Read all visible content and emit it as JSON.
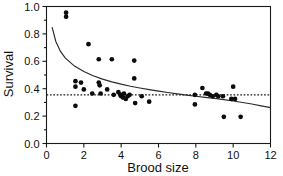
{
  "chart_data": {
    "type": "scatter",
    "title": "",
    "xlabel": "Brood size",
    "ylabel": "Survival",
    "xlim": [
      0,
      12
    ],
    "ylim": [
      0,
      1.0
    ],
    "xticks": [
      0,
      2,
      4,
      6,
      8,
      10,
      12
    ],
    "xticklabels": [
      "0",
      "2",
      "4",
      "6",
      "8",
      "10",
      "12"
    ],
    "yticks": [
      0.0,
      0.2,
      0.4,
      0.6,
      0.8,
      1.0
    ],
    "yticklabels": [
      "0.0",
      "0.2",
      "0.4",
      "0.6",
      "0.8",
      "1.0"
    ],
    "grid": false,
    "legend": null,
    "marker": "filled-circle",
    "marker_color": "#0b0b0b",
    "points": [
      {
        "x": 1.05,
        "y": 0.955
      },
      {
        "x": 1.05,
        "y": 0.925
      },
      {
        "x": 1.55,
        "y": 0.455
      },
      {
        "x": 1.55,
        "y": 0.415
      },
      {
        "x": 1.55,
        "y": 0.275
      },
      {
        "x": 1.85,
        "y": 0.445
      },
      {
        "x": 2.0,
        "y": 0.395
      },
      {
        "x": 2.25,
        "y": 0.725
      },
      {
        "x": 2.45,
        "y": 0.365
      },
      {
        "x": 2.8,
        "y": 0.615
      },
      {
        "x": 2.8,
        "y": 0.445
      },
      {
        "x": 2.85,
        "y": 0.425
      },
      {
        "x": 2.9,
        "y": 0.365
      },
      {
        "x": 3.25,
        "y": 0.395
      },
      {
        "x": 3.5,
        "y": 0.615
      },
      {
        "x": 3.6,
        "y": 0.355
      },
      {
        "x": 3.85,
        "y": 0.375
      },
      {
        "x": 3.95,
        "y": 0.355
      },
      {
        "x": 4.0,
        "y": 0.345
      },
      {
        "x": 4.05,
        "y": 0.355
      },
      {
        "x": 4.1,
        "y": 0.335
      },
      {
        "x": 4.15,
        "y": 0.365
      },
      {
        "x": 4.25,
        "y": 0.325
      },
      {
        "x": 4.35,
        "y": 0.345
      },
      {
        "x": 4.45,
        "y": 0.355
      },
      {
        "x": 4.7,
        "y": 0.605
      },
      {
        "x": 4.7,
        "y": 0.475
      },
      {
        "x": 4.75,
        "y": 0.295
      },
      {
        "x": 5.1,
        "y": 0.345
      },
      {
        "x": 5.5,
        "y": 0.305
      },
      {
        "x": 7.95,
        "y": 0.355
      },
      {
        "x": 7.95,
        "y": 0.285
      },
      {
        "x": 8.35,
        "y": 0.405
      },
      {
        "x": 8.55,
        "y": 0.365
      },
      {
        "x": 8.65,
        "y": 0.365
      },
      {
        "x": 8.75,
        "y": 0.355
      },
      {
        "x": 8.9,
        "y": 0.345
      },
      {
        "x": 9.1,
        "y": 0.355
      },
      {
        "x": 9.2,
        "y": 0.345
      },
      {
        "x": 9.45,
        "y": 0.345
      },
      {
        "x": 9.5,
        "y": 0.195
      },
      {
        "x": 9.9,
        "y": 0.325
      },
      {
        "x": 10.0,
        "y": 0.415
      },
      {
        "x": 10.1,
        "y": 0.325
      },
      {
        "x": 10.4,
        "y": 0.195
      }
    ],
    "fit_curve": {
      "label": "fitted-decay-curve",
      "style": "solid",
      "color": "#2b2b2b",
      "points": [
        {
          "x": 0.3,
          "y": 0.85
        },
        {
          "x": 0.5,
          "y": 0.745
        },
        {
          "x": 0.75,
          "y": 0.672
        },
        {
          "x": 1.0,
          "y": 0.625
        },
        {
          "x": 1.5,
          "y": 0.565
        },
        {
          "x": 2.0,
          "y": 0.525
        },
        {
          "x": 2.5,
          "y": 0.494
        },
        {
          "x": 3.0,
          "y": 0.47
        },
        {
          "x": 3.5,
          "y": 0.45
        },
        {
          "x": 4.0,
          "y": 0.433
        },
        {
          "x": 4.5,
          "y": 0.418
        },
        {
          "x": 5.0,
          "y": 0.405
        },
        {
          "x": 5.5,
          "y": 0.393
        },
        {
          "x": 6.0,
          "y": 0.382
        },
        {
          "x": 6.5,
          "y": 0.372
        },
        {
          "x": 7.0,
          "y": 0.362
        },
        {
          "x": 7.5,
          "y": 0.353
        },
        {
          "x": 8.0,
          "y": 0.345
        },
        {
          "x": 8.5,
          "y": 0.337
        },
        {
          "x": 9.0,
          "y": 0.329
        },
        {
          "x": 9.5,
          "y": 0.32
        },
        {
          "x": 10.0,
          "y": 0.31
        },
        {
          "x": 10.5,
          "y": 0.299
        },
        {
          "x": 11.0,
          "y": 0.288
        },
        {
          "x": 11.5,
          "y": 0.275
        },
        {
          "x": 12.0,
          "y": 0.262
        }
      ]
    },
    "reference_line": {
      "label": "mean-survival-dashed-line",
      "orientation": "horizontal",
      "y": 0.355,
      "style": "dashed",
      "color": "#1a1a1a"
    }
  }
}
